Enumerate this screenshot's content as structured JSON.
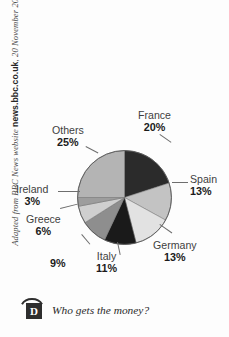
{
  "source_credit": {
    "prefix": "Adapted from BBC News website ",
    "site": "news.bbc.co.uk",
    "date": ", 20 November 2008",
    "full": "Adapted from BBC News website news.bbc.co.uk, 20 November 2008"
  },
  "footer": {
    "badge_letter": "D",
    "question": "Who gets the money?"
  },
  "chart_data": {
    "type": "pie",
    "title": "",
    "subtitle": "",
    "xlabel": "",
    "ylabel": "",
    "legend_position": "labels-outside",
    "grid": false,
    "units": "%",
    "start_angle_deg": 0,
    "direction": "clockwise",
    "categories": [
      "France",
      "Spain",
      "Germany",
      "Italy",
      "Unlabelled",
      "Greece",
      "Ireland",
      "Others"
    ],
    "values": [
      20,
      13,
      13,
      11,
      9,
      6,
      3,
      25
    ],
    "slices": [
      {
        "label": "France",
        "value": 20,
        "display": "20%",
        "color": "#2b2b2b"
      },
      {
        "label": "Spain",
        "value": 13,
        "display": "13%",
        "color": "#c3c3c3"
      },
      {
        "label": "Germany",
        "value": 13,
        "display": "13%",
        "color": "#e2e2e2"
      },
      {
        "label": "Italy",
        "value": 11,
        "display": "11%",
        "color": "#1a1a1a"
      },
      {
        "label": "",
        "value": 9,
        "display": "9%",
        "color": "#8e8e8e"
      },
      {
        "label": "Greece",
        "value": 6,
        "display": "6%",
        "color": "#cfcfcf"
      },
      {
        "label": "Ireland",
        "value": 3,
        "display": "3%",
        "color": "#9d9d9d"
      },
      {
        "label": "Others",
        "value": 25,
        "display": "25%",
        "color": "#b4b4b4"
      }
    ],
    "labels": {
      "france": {
        "name": "France",
        "pct": "20%"
      },
      "spain": {
        "name": "Spain",
        "pct": "13%"
      },
      "germany": {
        "name": "Germany",
        "pct": "13%"
      },
      "italy": {
        "name": "Italy",
        "pct": "11%"
      },
      "nine": {
        "name": "",
        "pct": "9%"
      },
      "greece": {
        "name": "Greece",
        "pct": "6%"
      },
      "ireland": {
        "name": "Ireland",
        "pct": "3%"
      },
      "others": {
        "name": "Others",
        "pct": "25%"
      }
    }
  }
}
